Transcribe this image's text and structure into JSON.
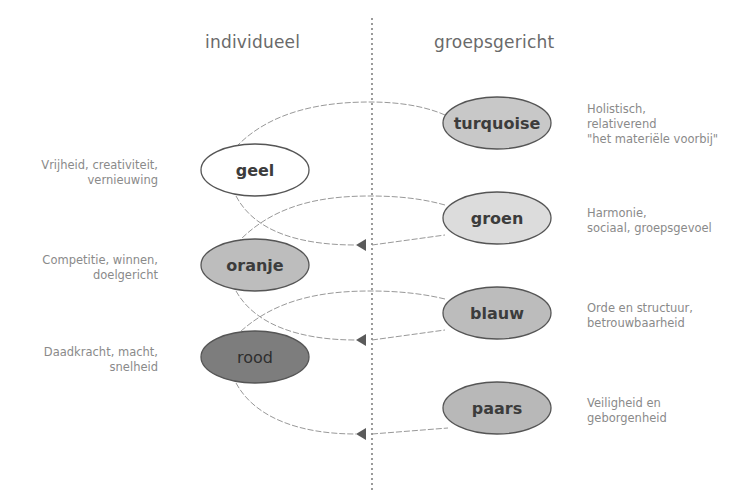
{
  "headers": {
    "left": "individueel",
    "right": "groepsgericht"
  },
  "colors": {
    "divider": "#666666",
    "connector": "#8c8c8c",
    "arrow": "#5a5a5a",
    "ellipse_stroke": "#555555",
    "description_text": "#8a8a8a",
    "header_text": "#6a6a6a"
  },
  "levels": [
    {
      "id": "turquoise",
      "label": "turquoise",
      "side": "right",
      "fill": "#c8c8c8",
      "description": [
        "Holistisch,",
        "relativerend",
        "\"het materiële voorbij\""
      ]
    },
    {
      "id": "geel",
      "label": "geel",
      "side": "left",
      "fill": "#ffffff",
      "description": [
        "Vrijheid, creativiteit,",
        "vernieuwing"
      ]
    },
    {
      "id": "groen",
      "label": "groen",
      "side": "right",
      "fill": "#dcdcdc",
      "description": [
        "Harmonie,",
        "sociaal, groepsgevoel"
      ]
    },
    {
      "id": "oranje",
      "label": "oranje",
      "side": "left",
      "fill": "#bdbdbd",
      "description": [
        "Competitie, winnen,",
        "doelgericht"
      ]
    },
    {
      "id": "blauw",
      "label": "blauw",
      "side": "right",
      "fill": "#bcbcbc",
      "description": [
        "Orde en structuur,",
        "betrouwbaarheid"
      ]
    },
    {
      "id": "rood",
      "label": "rood",
      "side": "left",
      "fill": "#7d7d7d",
      "description": [
        "Daadkracht, macht,",
        "snelheid"
      ]
    },
    {
      "id": "paars",
      "label": "paars",
      "side": "right",
      "fill": "#b8b8b8",
      "description": [
        "Veiligheid en",
        "geborgenheid"
      ]
    }
  ]
}
